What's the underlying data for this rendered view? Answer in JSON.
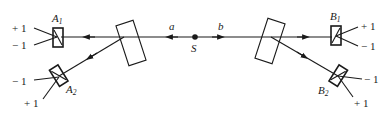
{
  "diagram": {
    "type": "optics-schematic",
    "colors": {
      "stroke": "#1a1a1a",
      "background": "#ffffff"
    },
    "source": {
      "label": "S"
    },
    "beams": [
      {
        "label": "a",
        "direction": "left"
      },
      {
        "label": "b",
        "direction": "right"
      }
    ],
    "splitters": [
      {
        "side": "left"
      },
      {
        "side": "right"
      }
    ],
    "analyzers": [
      {
        "name": "A",
        "sub": "1",
        "outputs": [
          "+ 1",
          "− 1"
        ]
      },
      {
        "name": "A",
        "sub": "2",
        "outputs": [
          "− 1",
          "+ 1"
        ]
      },
      {
        "name": "B",
        "sub": "1",
        "outputs": [
          "+ 1",
          "− 1"
        ]
      },
      {
        "name": "B",
        "sub": "2",
        "outputs": [
          "− 1",
          "+ 1"
        ]
      }
    ]
  }
}
